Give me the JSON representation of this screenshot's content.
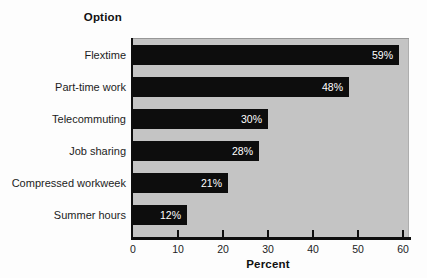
{
  "chart_data": {
    "type": "bar",
    "orientation": "horizontal",
    "title": "",
    "ylabel": "Option",
    "xlabel": "Percent",
    "categories": [
      "Flextime",
      "Part-time work",
      "Telecommuting",
      "Job sharing",
      "Compressed workweek",
      "Summer hours"
    ],
    "values": [
      59,
      48,
      30,
      28,
      21,
      12
    ],
    "value_labels": [
      "59%",
      "48%",
      "30%",
      "28%",
      "21%",
      "12%"
    ],
    "xlim": [
      0,
      60
    ],
    "xticks": [
      0,
      10,
      20,
      30,
      40,
      50,
      60
    ],
    "grid": false,
    "legend": false,
    "colors": {
      "bar": "#0d0d0d",
      "plot_background": "#c4c4c4",
      "page_background": "#fdfdfd",
      "value_label_text": "#ffffff",
      "axis_text": "#1c1c1c"
    }
  }
}
